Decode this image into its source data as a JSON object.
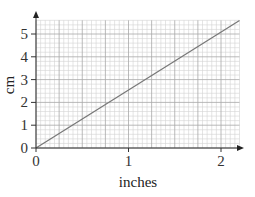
{
  "chart_data": {
    "type": "line",
    "title": "",
    "xlabel": "inches",
    "ylabel": "cm",
    "xlim": [
      0,
      2.2
    ],
    "ylim": [
      0,
      5.6
    ],
    "x_ticks": [
      0,
      1,
      2
    ],
    "y_ticks": [
      0,
      1,
      2,
      3,
      4,
      5
    ],
    "x_tick_labels": [
      "0",
      "1",
      "2"
    ],
    "y_tick_labels": [
      "0",
      "1",
      "2",
      "3",
      "4",
      "5"
    ],
    "grid": true,
    "grid_minor_x_step": 0.05,
    "grid_major_x_step": 0.25,
    "grid_minor_y_step": 0.2,
    "grid_major_y_step": 1,
    "legend": null,
    "series": [
      {
        "name": "cm = 2.54 × inches",
        "x": [
          0,
          2.2
        ],
        "y": [
          0,
          5.588
        ]
      }
    ],
    "colors": {
      "line": "#777777",
      "grid_minor": "#d4d4d4",
      "grid_major": "#a8a8a8",
      "axis": "#333333"
    }
  }
}
